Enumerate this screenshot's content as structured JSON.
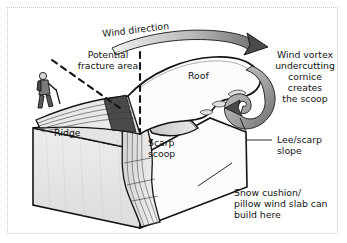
{
  "figure": {
    "kind": "cross-section-illustration",
    "background_color": "#ffffff",
    "line_color": "#141414",
    "fill_light": "#ececec",
    "fill_mid": "#d6d6d6",
    "fill_dark": "#8f8f8f",
    "frame_color": "#c9c9c9"
  },
  "labels": {
    "wind_direction": "Wind direction",
    "potential_fracture_line1": "Potential",
    "potential_fracture_line2": "fracture area",
    "roof": "Roof",
    "ridge": "Ridge",
    "scarp_line1": "Scarp",
    "scarp_line2": "scoop",
    "vortex_line1": "Wind vortex",
    "vortex_line2": "undercutting",
    "vortex_line3": "cornice",
    "vortex_line4": "creates",
    "vortex_line5": "the scoop",
    "lee_line1": "Lee/scarp",
    "lee_line2": "slope",
    "cushion_line1": "Snow cushion/",
    "cushion_line2": "pillow wind slab can",
    "cushion_line3": "build here"
  }
}
